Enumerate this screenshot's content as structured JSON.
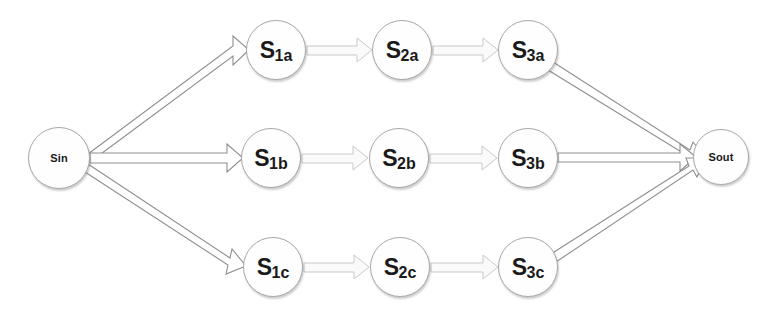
{
  "diagram": {
    "canvas": {
      "width": 773,
      "height": 318,
      "background": "#ffffff"
    },
    "style": {
      "node_fill": "#fefefe",
      "node_stroke": "#a8a8a8",
      "label_color": "#1a1a1a",
      "thick_edge_stroke": "#8c8c8c",
      "thin_edge_stroke": "#c9c9c9"
    },
    "terminals": [
      {
        "id": "Sin",
        "label": "Sin",
        "cx": 59,
        "cy": 158,
        "r": 31
      },
      {
        "id": "Sout",
        "label": "Sout",
        "cx": 721,
        "cy": 157,
        "r": 28
      }
    ],
    "rows": [
      {
        "id": "row-a",
        "suffix": "a",
        "cy": 50,
        "nodes": [
          {
            "id": "S1a",
            "prefix": "S",
            "sub": "1a",
            "cx": 276,
            "cy": 50,
            "r": 30
          },
          {
            "id": "S2a",
            "prefix": "S",
            "sub": "2a",
            "cx": 402,
            "cy": 50,
            "r": 30
          },
          {
            "id": "S3a",
            "prefix": "S",
            "sub": "3a",
            "cx": 528,
            "cy": 50,
            "r": 30
          }
        ]
      },
      {
        "id": "row-b",
        "suffix": "b",
        "cy": 158,
        "nodes": [
          {
            "id": "S1b",
            "prefix": "S",
            "sub": "1b",
            "cx": 271,
            "cy": 158,
            "r": 30
          },
          {
            "id": "S2b",
            "prefix": "S",
            "sub": "2b",
            "cx": 399,
            "cy": 158,
            "r": 30
          },
          {
            "id": "S3b",
            "prefix": "S",
            "sub": "3b",
            "cx": 528,
            "cy": 158,
            "r": 30
          }
        ]
      },
      {
        "id": "row-c",
        "suffix": "c",
        "cy": 267,
        "nodes": [
          {
            "id": "S1c",
            "prefix": "S",
            "sub": "1c",
            "cx": 273,
            "cy": 267,
            "r": 30
          },
          {
            "id": "S2c",
            "prefix": "S",
            "sub": "2c",
            "cx": 400,
            "cy": 267,
            "r": 30
          },
          {
            "id": "S3c",
            "prefix": "S",
            "sub": "3c",
            "cx": 528,
            "cy": 267,
            "r": 30
          }
        ]
      }
    ],
    "edges": [
      {
        "id": "e-sin-s1a",
        "from": "Sin",
        "to": "S1a",
        "kind": "thick"
      },
      {
        "id": "e-sin-s1b",
        "from": "Sin",
        "to": "S1b",
        "kind": "thick"
      },
      {
        "id": "e-sin-s1c",
        "from": "Sin",
        "to": "S1c",
        "kind": "thick"
      },
      {
        "id": "e-s1a-s2a",
        "from": "S1a",
        "to": "S2a",
        "kind": "thin"
      },
      {
        "id": "e-s2a-s3a",
        "from": "S2a",
        "to": "S3a",
        "kind": "thin"
      },
      {
        "id": "e-s1b-s2b",
        "from": "S1b",
        "to": "S2b",
        "kind": "thin"
      },
      {
        "id": "e-s2b-s3b",
        "from": "S2b",
        "to": "S3b",
        "kind": "thin"
      },
      {
        "id": "e-s1c-s2c",
        "from": "S1c",
        "to": "S2c",
        "kind": "thin"
      },
      {
        "id": "e-s2c-s3c",
        "from": "S2c",
        "to": "S3c",
        "kind": "thin"
      },
      {
        "id": "e-s3a-sout",
        "from": "S3a",
        "to": "Sout",
        "kind": "thick"
      },
      {
        "id": "e-s3b-sout",
        "from": "S3b",
        "to": "Sout",
        "kind": "thick"
      },
      {
        "id": "e-s3c-sout",
        "from": "S3c",
        "to": "Sout",
        "kind": "thick"
      }
    ]
  }
}
